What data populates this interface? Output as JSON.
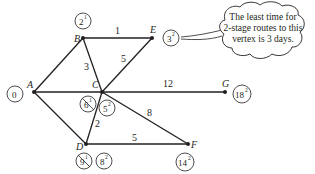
{
  "vertices": {
    "A": {
      "label": "A",
      "value": "0",
      "stage": ""
    },
    "B": {
      "label": "B",
      "value": "2",
      "stage": "1"
    },
    "C": {
      "label": "C",
      "old_value": "6",
      "old_stage": "1",
      "value": "5",
      "stage": "2"
    },
    "D": {
      "label": "D",
      "old_value": "9",
      "old_stage": "1",
      "value": "8",
      "stage": "2"
    },
    "E": {
      "label": "E",
      "value": "3",
      "stage": "2"
    },
    "F": {
      "label": "F",
      "value": "14",
      "stage": "2"
    },
    "G": {
      "label": "G",
      "value": "18",
      "stage": "2"
    }
  },
  "edges": {
    "BE": "1",
    "BC": "3",
    "CE": "5",
    "CG": "12",
    "CF": "8",
    "CD": "2",
    "DF": "5"
  },
  "callout": {
    "line1": "The least time for",
    "line2": "2-stage routes to this",
    "line3": "vertex is 3 days."
  }
}
